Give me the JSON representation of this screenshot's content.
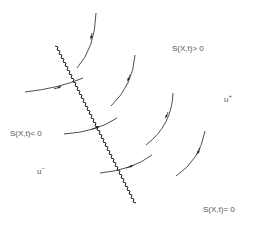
{
  "diagram": {
    "labels": {
      "positive_region": "S(X,t)> 0",
      "negative_region": "S(X,t)< 0",
      "shock_front": "S(X,t)= 0",
      "u_plus_base": "u",
      "u_plus_sup": "+",
      "u_minus_base": "u",
      "u_minus_sup": "−"
    },
    "colors": {
      "line": "#222222",
      "text": "#555555",
      "background": "#ffffff"
    }
  }
}
